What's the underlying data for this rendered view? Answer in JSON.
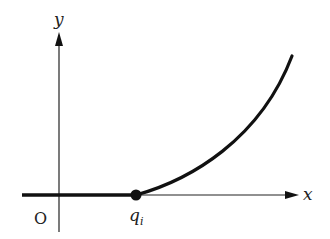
{
  "diagram": {
    "labels": {
      "y_axis": "y",
      "x_axis": "x",
      "origin": "O",
      "point": "q",
      "point_subscript": "i"
    },
    "colors": {
      "stroke": "#111111",
      "axis": "#222222",
      "background": "#ffffff"
    }
  }
}
